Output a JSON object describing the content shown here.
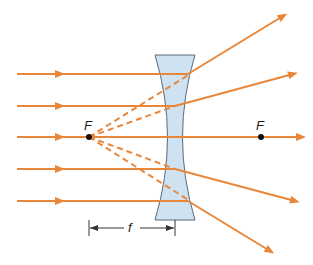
{
  "diagram": {
    "colors": {
      "ray": "#E8873A",
      "lens_fill": "#C9DFF0",
      "lens_stroke": "#4A5A6A",
      "focal_point": "#111111",
      "dimension": "#333333"
    },
    "labels": {
      "focal_left": "F",
      "focal_right": "F",
      "focal_length": "f"
    },
    "incoming_rays_y": [
      74,
      106,
      137,
      169,
      201
    ],
    "virtual_focus": {
      "x": 89,
      "y": 137
    },
    "real_focus_marker": {
      "x": 261,
      "y": 137
    }
  }
}
